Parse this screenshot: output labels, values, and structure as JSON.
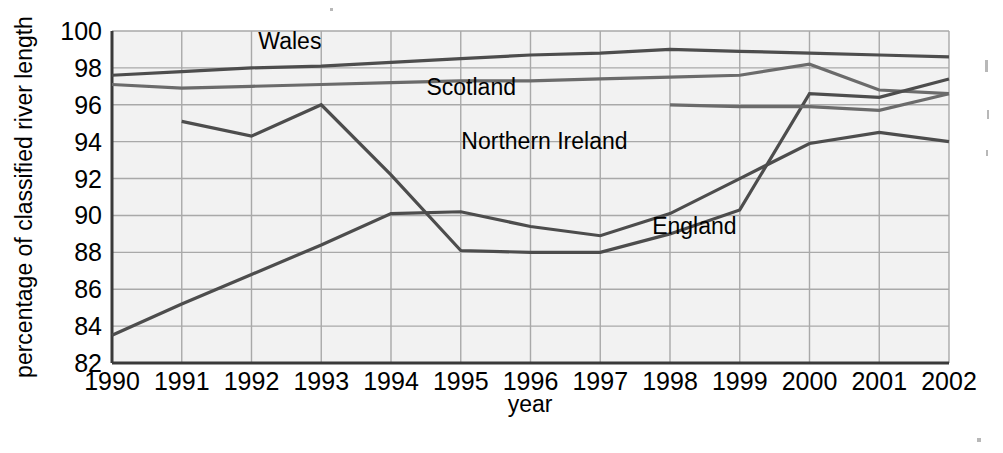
{
  "chart_data": {
    "type": "line",
    "title": "",
    "xlabel": "year",
    "ylabel": "percentage of classified river length",
    "x": [
      1990,
      1991,
      1992,
      1993,
      1994,
      1995,
      1996,
      1997,
      1998,
      1999,
      2000,
      2001,
      2002
    ],
    "xticklabels": [
      "1990",
      "1991",
      "1992",
      "1993",
      "1994",
      "1995",
      "1996",
      "1997",
      "1998",
      "1999",
      "2000",
      "2001",
      "2002"
    ],
    "yticklabels": [
      "82",
      "84",
      "86",
      "88",
      "90",
      "92",
      "94",
      "96",
      "98",
      "100"
    ],
    "yticks": [
      82,
      84,
      86,
      88,
      90,
      92,
      94,
      96,
      98,
      100
    ],
    "xlim": [
      1990,
      2002
    ],
    "ylim": [
      82,
      100
    ],
    "grid": true,
    "legend_position": "inline-labels",
    "series": [
      {
        "name": "Wales",
        "color": "#4d4d4d",
        "x": [
          1990,
          1991,
          1992,
          1993,
          1994,
          1995,
          1996,
          1997,
          1998,
          1999,
          2000,
          2001,
          2002
        ],
        "values": [
          97.6,
          97.8,
          98.0,
          98.1,
          98.3,
          98.5,
          98.7,
          98.8,
          99.0,
          98.9,
          98.8,
          98.7,
          98.6
        ]
      },
      {
        "name": "Scotland",
        "color": "#6b6b6b",
        "x": [
          1990,
          1991,
          1992,
          1993,
          1994,
          1995,
          1996,
          1997,
          1998,
          1999,
          2000,
          2001,
          2002
        ],
        "values": [
          97.1,
          96.9,
          97.0,
          97.1,
          97.2,
          97.3,
          97.3,
          97.4,
          97.5,
          97.6,
          98.2,
          96.8,
          96.6
        ]
      },
      {
        "name": "Northern Ireland",
        "color": "#4d4d4d",
        "x": [
          1991,
          1992,
          1993,
          1994,
          1995,
          1996,
          1997,
          1998,
          1999,
          2000,
          2001,
          2002
        ],
        "values": [
          95.1,
          94.3,
          96.0,
          92.2,
          88.1,
          88.0,
          88.0,
          89.0,
          90.3,
          96.6,
          96.4,
          97.4
        ]
      },
      {
        "name": "England",
        "color": "#4d4d4d",
        "x": [
          1990,
          1991,
          1992,
          1993,
          1994,
          1995,
          1996,
          1997,
          1998,
          1999,
          2000,
          2001,
          2002
        ],
        "values": [
          83.5,
          85.2,
          86.8,
          88.4,
          90.1,
          90.2,
          89.4,
          88.9,
          90.1,
          92.0,
          93.9,
          94.5,
          94.0
        ]
      },
      {
        "name": "Northern Ireland upper",
        "color": "#6b6b6b",
        "x": [
          1998,
          1999,
          2000,
          2001,
          2002
        ],
        "values": [
          96.0,
          95.9,
          95.9,
          95.7,
          96.6
        ]
      }
    ],
    "annotations": [
      {
        "text": "Wales",
        "x": 1992.55,
        "y": 99.05
      },
      {
        "text": "Scotland",
        "x": 1995.15,
        "y": 96.55
      },
      {
        "text": "Northern Ireland",
        "x": 1996.2,
        "y": 93.6
      },
      {
        "text": "England",
        "x": 1998.35,
        "y": 89.0
      }
    ]
  },
  "axis": {
    "y_label": "percentage of classified river length",
    "x_label": "year"
  }
}
